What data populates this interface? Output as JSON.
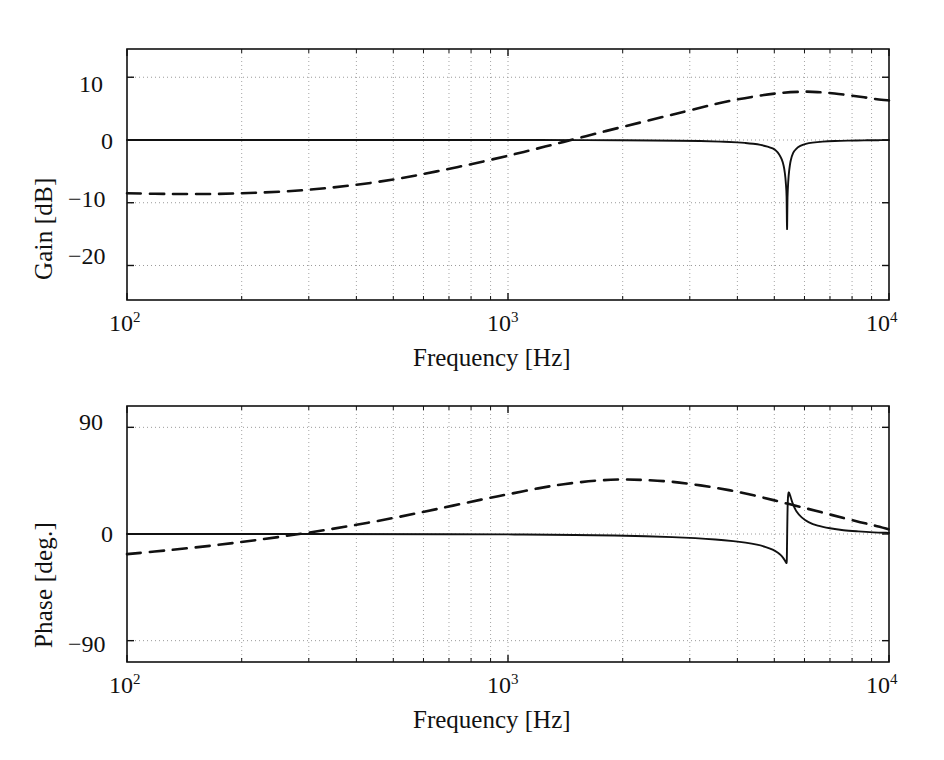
{
  "figure": {
    "kind": "bode-plot",
    "background": "#ffffff",
    "line_color": "#111111",
    "grid_color": "#9a9a9a"
  },
  "chart_data": [
    {
      "type": "line",
      "title": "",
      "subtitle": "",
      "panel": "gain",
      "xlabel": "Frequency [Hz]",
      "ylabel": "Gain [dB]",
      "xscale": "log",
      "xlim": [
        100,
        10000
      ],
      "ylim": [
        -25.5,
        14.5
      ],
      "xticks": [
        100,
        1000,
        10000
      ],
      "xticklabels": [
        "10",
        "10",
        "10"
      ],
      "xtickexponents": [
        "2",
        "3",
        "4"
      ],
      "yticks": [
        10,
        0,
        -10,
        -20
      ],
      "yticklabels": [
        "10",
        "0",
        "−10",
        "−20"
      ],
      "grid": true,
      "grid_style": "dotted",
      "legend": "none",
      "series": [
        {
          "name": "notch-filter",
          "style": "solid",
          "notch_freq_hz": 5400,
          "notch_depth_db": -14.2,
          "points": [
            [
              100,
              0.0
            ],
            [
              200,
              0.0
            ],
            [
              400,
              0.0
            ],
            [
              800,
              0.0
            ],
            [
              1200,
              0.0
            ],
            [
              1600,
              -0.02
            ],
            [
              2000,
              -0.04
            ],
            [
              2400,
              -0.07
            ],
            [
              2800,
              -0.11
            ],
            [
              3200,
              -0.17
            ],
            [
              3600,
              -0.26
            ],
            [
              4000,
              -0.38
            ],
            [
              4200,
              -0.47
            ],
            [
              4400,
              -0.6
            ],
            [
              4600,
              -0.78
            ],
            [
              4800,
              -1.05
            ],
            [
              4950,
              -1.35
            ],
            [
              5050,
              -1.7
            ],
            [
              5150,
              -2.3
            ],
            [
              5230,
              -3.1
            ],
            [
              5290,
              -4.1
            ],
            [
              5330,
              -5.3
            ],
            [
              5360,
              -6.8
            ],
            [
              5385,
              -9.0
            ],
            [
              5400,
              -14.2
            ],
            [
              5415,
              -9.2
            ],
            [
              5440,
              -6.6
            ],
            [
              5470,
              -4.9
            ],
            [
              5520,
              -3.3
            ],
            [
              5600,
              -2.1
            ],
            [
              5700,
              -1.45
            ],
            [
              5850,
              -0.95
            ],
            [
              6050,
              -0.62
            ],
            [
              6300,
              -0.42
            ],
            [
              6700,
              -0.26
            ],
            [
              7200,
              -0.16
            ],
            [
              7800,
              -0.1
            ],
            [
              8600,
              -0.06
            ],
            [
              9400,
              -0.03
            ],
            [
              10000,
              -0.02
            ]
          ]
        },
        {
          "name": "lead-compensator",
          "style": "dashed",
          "points": [
            [
              100,
              -8.5
            ],
            [
              130,
              -8.6
            ],
            [
              170,
              -8.6
            ],
            [
              220,
              -8.4
            ],
            [
              290,
              -8.0
            ],
            [
              380,
              -7.3
            ],
            [
              500,
              -6.3
            ],
            [
              650,
              -5.0
            ],
            [
              850,
              -3.5
            ],
            [
              1100,
              -1.9
            ],
            [
              1400,
              -0.3
            ],
            [
              1800,
              1.4
            ],
            [
              2300,
              3.0
            ],
            [
              2900,
              4.5
            ],
            [
              3600,
              5.9
            ],
            [
              4400,
              6.9
            ],
            [
              5200,
              7.5
            ],
            [
              6000,
              7.7
            ],
            [
              6600,
              7.6
            ],
            [
              7200,
              7.4
            ],
            [
              7900,
              7.1
            ],
            [
              8600,
              6.8
            ],
            [
              9300,
              6.5
            ],
            [
              10000,
              6.3
            ]
          ]
        }
      ]
    },
    {
      "type": "line",
      "title": "",
      "subtitle": "",
      "panel": "phase",
      "xlabel": "Frequency [Hz]",
      "ylabel": "Phase [deg.]",
      "xscale": "log",
      "xlim": [
        100,
        10000
      ],
      "ylim": [
        -108,
        108
      ],
      "xticks": [
        100,
        1000,
        10000
      ],
      "xticklabels": [
        "10",
        "10",
        "10"
      ],
      "xtickexponents": [
        "2",
        "3",
        "4"
      ],
      "yticks": [
        90,
        0,
        -90
      ],
      "yticklabels": [
        "90",
        "0",
        "−90"
      ],
      "grid": true,
      "grid_style": "dotted",
      "legend": "none",
      "series": [
        {
          "name": "notch-filter",
          "style": "solid",
          "notch_freq_hz": 5400,
          "min_deg": -24.0,
          "max_deg": 35.0,
          "points": [
            [
              100,
              0.0
            ],
            [
              300,
              0.0
            ],
            [
              700,
              -0.2
            ],
            [
              1100,
              -0.4
            ],
            [
              1500,
              -0.8
            ],
            [
              1900,
              -1.3
            ],
            [
              2300,
              -1.9
            ],
            [
              2700,
              -2.6
            ],
            [
              3100,
              -3.5
            ],
            [
              3500,
              -4.6
            ],
            [
              3900,
              -6.0
            ],
            [
              4200,
              -7.3
            ],
            [
              4500,
              -9.0
            ],
            [
              4750,
              -11.0
            ],
            [
              4950,
              -13.2
            ],
            [
              5100,
              -15.6
            ],
            [
              5200,
              -17.8
            ],
            [
              5280,
              -20.3
            ],
            [
              5330,
              -22.4
            ],
            [
              5365,
              -23.8
            ],
            [
              5390,
              -23.2
            ],
            [
              5400,
              -8.0
            ],
            [
              5412,
              14.0
            ],
            [
              5425,
              28.0
            ],
            [
              5440,
              33.5
            ],
            [
              5465,
              35.0
            ],
            [
              5520,
              31.0
            ],
            [
              5600,
              25.0
            ],
            [
              5720,
              19.0
            ],
            [
              5900,
              14.0
            ],
            [
              6150,
              10.0
            ],
            [
              6500,
              7.0
            ],
            [
              7000,
              4.8
            ],
            [
              7600,
              3.2
            ],
            [
              8300,
              2.2
            ],
            [
              9100,
              1.4
            ],
            [
              10000,
              0.9
            ]
          ]
        },
        {
          "name": "lead-compensator",
          "style": "dashed",
          "points": [
            [
              100,
              -17.0
            ],
            [
              130,
              -13.5
            ],
            [
              170,
              -9.5
            ],
            [
              220,
              -5.0
            ],
            [
              290,
              0.5
            ],
            [
              380,
              6.5
            ],
            [
              500,
              13.5
            ],
            [
              650,
              21.0
            ],
            [
              850,
              29.0
            ],
            [
              1000,
              33.5
            ],
            [
              1200,
              38.5
            ],
            [
              1400,
              42.0
            ],
            [
              1700,
              45.0
            ],
            [
              2000,
              46.0
            ],
            [
              2300,
              45.5
            ],
            [
              2700,
              44.0
            ],
            [
              3200,
              41.0
            ],
            [
              3800,
              37.0
            ],
            [
              4500,
              32.0
            ],
            [
              5200,
              27.0
            ],
            [
              6000,
              22.0
            ],
            [
              6800,
              17.5
            ],
            [
              7600,
              13.5
            ],
            [
              8400,
              10.0
            ],
            [
              9200,
              7.0
            ],
            [
              10000,
              4.0
            ]
          ]
        }
      ]
    }
  ],
  "gain_panel": {
    "ylabel": "Gain [dB]",
    "xlabel": "Frequency [Hz]",
    "yticks": [
      "10",
      "0",
      "−10",
      "−20"
    ],
    "xtick_mantissa": "10",
    "xtick_exponents": [
      "2",
      "3",
      "4"
    ]
  },
  "phase_panel": {
    "ylabel": "Phase [deg.]",
    "xlabel": "Frequency [Hz]",
    "yticks": [
      "90",
      "0",
      "−90"
    ],
    "xtick_mantissa": "10",
    "xtick_exponents": [
      "2",
      "3",
      "4"
    ]
  }
}
